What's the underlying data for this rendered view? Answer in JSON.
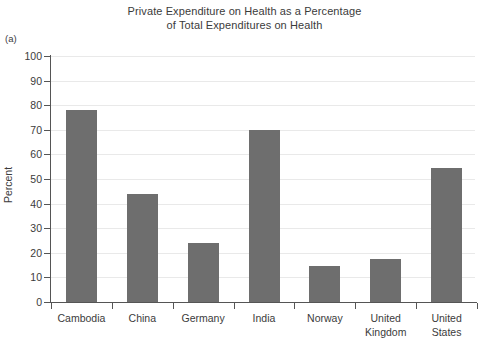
{
  "panel_label": "(a)",
  "title_lines": [
    "Private Expenditure on Health as a Percentage",
    "of Total Expenditures on Health"
  ],
  "axes": {
    "ylabel": "Percent",
    "xlabel": "",
    "y_ticks": [
      "0",
      "10",
      "20",
      "30",
      "40",
      "50",
      "60",
      "70",
      "80",
      "90",
      "100"
    ]
  },
  "style": {
    "bar_color": "#6e6e6e",
    "grid_color": "#e9e9e9",
    "axis_color": "#555555",
    "text_color": "#3b3b3b",
    "background": "#ffffff"
  },
  "categories_display": [
    [
      "Cambodia"
    ],
    [
      "China"
    ],
    [
      "Germany"
    ],
    [
      "India"
    ],
    [
      "Norway"
    ],
    [
      "United",
      "Kingdom"
    ],
    [
      "United",
      "States"
    ]
  ],
  "chart_data": {
    "type": "bar",
    "title": "Private Expenditure on Health as a Percentage of Total Expenditures on Health",
    "subtitle": "",
    "xlabel": "",
    "ylabel": "Percent",
    "ylim": [
      0,
      100
    ],
    "ytick_step": 10,
    "grid": "horizontal",
    "legend": "none",
    "categories": [
      "Cambodia",
      "China",
      "Germany",
      "India",
      "Norway",
      "United Kingdom",
      "United States"
    ],
    "values": [
      78,
      44,
      24,
      70,
      14.5,
      17.5,
      54.5
    ],
    "value_unit": "percent"
  }
}
